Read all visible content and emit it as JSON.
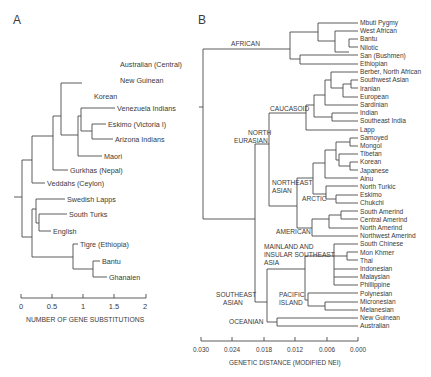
{
  "panels": {
    "a": {
      "label": "A",
      "leaves": [
        "Australian (Central)",
        "New Guinean",
        "Korean",
        "Venezuela Indians",
        "Eskimo (Victoria I)",
        "Arizona Indians",
        "Maori",
        "Gurkhas (Nepal)",
        "Veddahs (Ceylon)",
        "Swedish Lapps",
        "South Turks",
        "English",
        "Tigre (Ethiopia)",
        "Bantu",
        "Ghanaien"
      ],
      "axis": {
        "title": "NUMBER OF GENE SUBSTITUTIONS",
        "ticks": [
          "0",
          "0.5",
          "1",
          "1.5",
          "2"
        ]
      }
    },
    "b": {
      "label": "B",
      "leaves": [
        "Mbuti Pygmy",
        "West African",
        "Bantu",
        "Nilotic",
        "San (Bushmen)",
        "Ethiopian",
        "Berber, North African",
        "Southwest Asian",
        "Iranian",
        "European",
        "Sardinian",
        "Indian",
        "Southeast India",
        "Lapp",
        "Samoyed",
        "Mongol",
        "Tibetan",
        "Korean",
        "Japanese",
        "Ainu",
        "North Turkic",
        "Eskimo",
        "Chukchi",
        "South Amerind",
        "Central Amerind",
        "North Amerind",
        "Northwest Amerind",
        "South Chinese",
        "Mon Khmer",
        "Thai",
        "Indonesian",
        "Malaysian",
        "Phillippine",
        "Polynesian",
        "Micronesian",
        "Melanesian",
        "New Guinean",
        "Australian"
      ],
      "groups": {
        "african": "AFRICAN",
        "caucasoid": "CAUCASOID",
        "north_eurasian_1": "NORTH",
        "north_eurasian_2": "EURASIAN",
        "northeast_asian_1": "NORTHEAST",
        "northeast_asian_2": "ASIAN",
        "arctic": "ARCTIC",
        "american": "AMERICAN",
        "mainland_1": "MAINLAND AND",
        "mainland_2": "INSULAR SOUTHEAST",
        "mainland_3": "ASIA",
        "pacific_1": "PACIFIC",
        "pacific_2": "ISLAND",
        "southeast_asian_1": "SOUTHEAST",
        "southeast_asian_2": "ASIAN",
        "oceanian": "OCEANIAN"
      },
      "axis": {
        "title": "GENETIC DISTANCE (MODIFIED NEI)",
        "ticks": [
          "0.030",
          "0.024",
          "0.018",
          "0.012",
          "0.006",
          "0.000"
        ]
      }
    }
  }
}
